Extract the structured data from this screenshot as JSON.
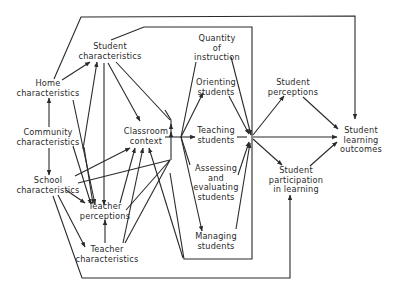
{
  "diagram": {
    "type": "flow-model",
    "nodes": {
      "student_characteristics": {
        "line1": "Student",
        "line2": "characteristics"
      },
      "home_characteristics": {
        "line1": "Home",
        "line2": "characteristics"
      },
      "community_characteristics": {
        "line1": "Community",
        "line2": "characteristics"
      },
      "school_characteristics": {
        "line1": "School",
        "line2": "characteristics"
      },
      "teacher_perceptions": {
        "line1": "Teacher",
        "line2": "perceptions"
      },
      "teacher_characteristics": {
        "line1": "Teacher",
        "line2": "characteristics"
      },
      "classroom_context": {
        "line1": "Classroom",
        "line2": "context"
      },
      "quantity_of_instruction": {
        "line1": "Quantity",
        "line2": "of",
        "line3": "instruction"
      },
      "orienting_students": {
        "line1": "Orienting",
        "line2": "students"
      },
      "teaching_students": {
        "line1": "Teaching",
        "line2": "students"
      },
      "assessing_students": {
        "line1": "Assessing",
        "line2": "and",
        "line3": "evaluating",
        "line4": "students"
      },
      "managing_students": {
        "line1": "Managing",
        "line2": "students"
      },
      "student_perceptions": {
        "line1": "Student",
        "line2": "perceptions"
      },
      "student_participation": {
        "line1": "Student",
        "line2": "participation",
        "line3": "in learning"
      },
      "student_learning_outcomes": {
        "line1": "Student",
        "line2": "learning",
        "line3": "outcomes"
      }
    },
    "edges": [
      [
        "home_characteristics",
        "student_characteristics"
      ],
      [
        "community_characteristics",
        "home_characteristics"
      ],
      [
        "community_characteristics",
        "school_characteristics"
      ],
      [
        "home_characteristics",
        "teacher_perceptions"
      ],
      [
        "community_characteristics",
        "teacher_perceptions"
      ],
      [
        "school_characteristics",
        "student_characteristics"
      ],
      [
        "school_characteristics",
        "classroom_context"
      ],
      [
        "school_characteristics",
        "teacher_perceptions"
      ],
      [
        "school_characteristics",
        "teacher_characteristics"
      ],
      [
        "student_characteristics",
        "teacher_perceptions"
      ],
      [
        "student_characteristics",
        "classroom_context"
      ],
      [
        "student_characteristics",
        "instruction"
      ],
      [
        "teacher_perceptions",
        "student_characteristics"
      ],
      [
        "teacher_perceptions",
        "classroom_context"
      ],
      [
        "teacher_characteristics",
        "teacher_perceptions"
      ],
      [
        "teacher_characteristics",
        "classroom_context"
      ],
      [
        "classroom_context",
        "instruction"
      ],
      [
        "instruction",
        "student_perceptions"
      ],
      [
        "instruction",
        "student_participation"
      ],
      [
        "instruction",
        "student_learning_outcomes"
      ],
      [
        "student_perceptions",
        "student_learning_outcomes"
      ],
      [
        "student_participation",
        "student_learning_outcomes"
      ],
      [
        "home_characteristics",
        "student_learning_outcomes"
      ],
      [
        "school_characteristics",
        "student_participation"
      ]
    ]
  }
}
